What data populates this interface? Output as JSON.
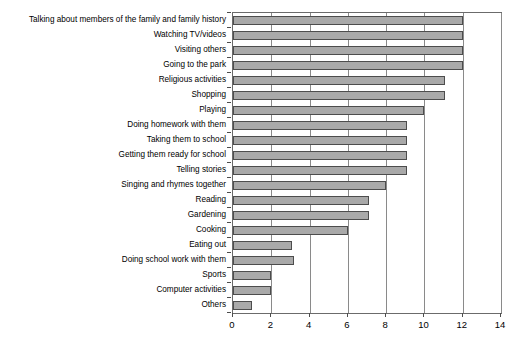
{
  "chart_data": {
    "type": "bar",
    "orientation": "horizontal",
    "title": "",
    "subtitle": "",
    "xlabel": "",
    "ylabel": "",
    "xlim": [
      0,
      14
    ],
    "xticks": [
      0,
      2,
      4,
      6,
      8,
      10,
      12,
      14
    ],
    "xtick_labels": [
      "0",
      "2",
      "4",
      "6",
      "8",
      "10",
      "12",
      "14"
    ],
    "grid": "vertical",
    "legend": "none",
    "bar_color": "#a9a9a9",
    "bar_edge_color": "#4d4d4d",
    "categories": [
      "Talking about members of the family and family history",
      "Watching TV/videos",
      "Visiting others",
      "Going to the park",
      "Religious activities",
      "Shopping",
      "Playing",
      "Doing homework with them",
      "Taking them to school",
      "Getting them ready for school",
      "Telling stories",
      "Singing and rhymes together",
      "Reading",
      "Gardening",
      "Cooking",
      "Eating out",
      "Doing school work with them",
      "Sports",
      "Computer activities",
      "Others"
    ],
    "values": [
      12,
      12,
      12,
      12,
      11.1,
      11.1,
      10,
      9.1,
      9.1,
      9.1,
      9.1,
      8,
      7.1,
      7.1,
      6,
      3.1,
      3.2,
      2,
      2,
      1
    ]
  }
}
